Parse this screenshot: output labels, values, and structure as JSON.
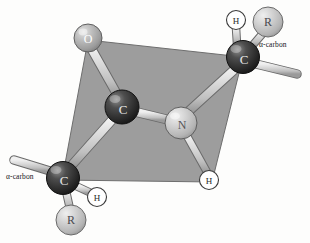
{
  "figure": {
    "type": "molecular-structure-diagram",
    "background_color": "#fdfdfc",
    "plane": {
      "name": "peptide-plane",
      "fill_color": "#9d9d9d",
      "stroke_color": "#6e6e6e",
      "points": "88,40 243,57 212,182 62,180"
    }
  },
  "atoms": [
    {
      "id": "oxygen",
      "label": "O",
      "kind": "oxygen",
      "x": 88,
      "y": 38,
      "r": 14,
      "fill": "#b6b6b6",
      "text_color": "#ffffff"
    },
    {
      "id": "carbonyl-c",
      "label": "C",
      "kind": "carbon",
      "x": 122,
      "y": 107,
      "r": 17,
      "fill": "#3a3a3a",
      "text_color": "#e8e8e8"
    },
    {
      "id": "nitrogen",
      "label": "N",
      "kind": "nitrogen",
      "x": 181,
      "y": 123,
      "r": 16,
      "fill": "#c9c9c9",
      "text_color": "#56565a"
    },
    {
      "id": "alpha-carbon-right",
      "label": "C",
      "kind": "alpha-carbon",
      "x": 243,
      "y": 57,
      "r": 16.5,
      "fill": "#323232",
      "text_color": "#e8e8e8"
    },
    {
      "id": "alpha-carbon-left",
      "label": "C",
      "kind": "alpha-carbon",
      "x": 63,
      "y": 178,
      "r": 16.5,
      "fill": "#323232",
      "text_color": "#e8e8e8"
    },
    {
      "id": "r-group-right",
      "label": "R",
      "kind": "r-group",
      "x": 268,
      "y": 22,
      "r": 15,
      "fill": "#c6c6c6",
      "text_color": "#4a4a4e"
    },
    {
      "id": "r-group-left",
      "label": "R",
      "kind": "r-group",
      "x": 71,
      "y": 220,
      "r": 15,
      "fill": "#c6c6c6",
      "text_color": "#4a4a4e"
    }
  ],
  "hydrogens": [
    {
      "id": "hydrogen-on-alpha-right",
      "label": "H",
      "x": 236,
      "y": 20,
      "r": 9.5,
      "fill": "#ffffff",
      "stroke": "#3a3a3a",
      "text_color": "#2a2a2a"
    },
    {
      "id": "hydrogen-on-nitrogen",
      "label": "H",
      "x": 209,
      "y": 180,
      "r": 9.5,
      "fill": "#ffffff",
      "stroke": "#3a3a3a",
      "text_color": "#2a2a2a"
    },
    {
      "id": "hydrogen-on-alpha-left",
      "label": "H",
      "x": 97,
      "y": 197,
      "r": 9.5,
      "fill": "#ffffff",
      "stroke": "#3a3a3a",
      "text_color": "#2a2a2a"
    }
  ],
  "bonds": [
    {
      "id": "bond-o-c",
      "from": "oxygen",
      "to": "carbonyl-c",
      "x1": 91,
      "y1": 50,
      "x2": 117,
      "y2": 95,
      "width": 8
    },
    {
      "id": "bond-c-n",
      "from": "carbonyl-c",
      "to": "nitrogen",
      "x1": 137,
      "y1": 112,
      "x2": 167,
      "y2": 120,
      "width": 8
    },
    {
      "id": "bond-c-alpha-left",
      "from": "carbonyl-c",
      "to": "alpha-carbon-left",
      "x1": 111,
      "y1": 120,
      "x2": 72,
      "y2": 165,
      "width": 8
    },
    {
      "id": "bond-n-alpha-right",
      "from": "nitrogen",
      "to": "alpha-carbon-right",
      "x1": 189,
      "y1": 110,
      "x2": 234,
      "y2": 70,
      "width": 8
    },
    {
      "id": "bond-n-h",
      "from": "nitrogen",
      "to": "hydrogen-on-nitrogen",
      "x1": 188,
      "y1": 137,
      "x2": 206,
      "y2": 171,
      "width": 7
    },
    {
      "id": "bond-alpha-right-h",
      "from": "alpha-carbon-right",
      "to": "hydrogen-on-alpha-right",
      "x1": 236,
      "y1": 43,
      "x2": 235,
      "y2": 29,
      "width": 7
    },
    {
      "id": "bond-alpha-right-r",
      "from": "alpha-carbon-right",
      "to": "r-group-right",
      "x1": 252,
      "y1": 45,
      "x2": 263,
      "y2": 33,
      "width": 7
    },
    {
      "id": "bond-alpha-right-free",
      "from": "alpha-carbon-right",
      "to": "chain-continuation-right",
      "x1": 256,
      "y1": 64,
      "x2": 297,
      "y2": 74,
      "width": 8
    },
    {
      "id": "bond-alpha-left-h",
      "from": "alpha-carbon-left",
      "to": "hydrogen-on-alpha-left",
      "x1": 76,
      "y1": 186,
      "x2": 90,
      "y2": 193,
      "width": 7
    },
    {
      "id": "bond-alpha-left-r",
      "from": "alpha-carbon-left",
      "to": "r-group-left",
      "x1": 66,
      "y1": 192,
      "x2": 70,
      "y2": 208,
      "width": 7
    },
    {
      "id": "bond-alpha-left-free",
      "from": "alpha-carbon-left",
      "to": "chain-continuation-left",
      "x1": 50,
      "y1": 171,
      "x2": 14,
      "y2": 160,
      "width": 8
    }
  ],
  "labels": {
    "alpha_carbon_right": "α-carbon",
    "alpha_carbon_left": "α-carbon"
  },
  "colors": {
    "bond_fill": "#d2d2d2",
    "bond_stroke": "#6a6a6a",
    "plane_fill": "#9d9d9d",
    "plane_stroke": "#6e6e6e",
    "text_dark": "#17161a"
  }
}
